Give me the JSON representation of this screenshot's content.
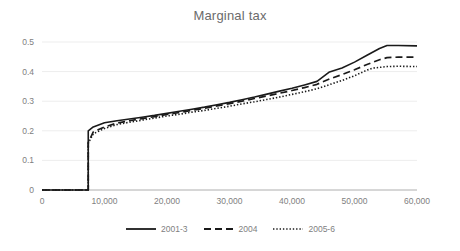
{
  "chart_data": {
    "type": "line",
    "title": "Marginal tax",
    "xlabel": "",
    "ylabel": "",
    "xlim": [
      0,
      60000
    ],
    "ylim": [
      0,
      0.5
    ],
    "grid": true,
    "grid_axis": "y",
    "legend_position": "bottom",
    "y_ticks": [
      "0",
      "0.1",
      "0.2",
      "0.3",
      "0.4",
      "0.5"
    ],
    "y_tick_values": [
      0,
      0.1,
      0.2,
      0.3,
      0.4,
      0.5
    ],
    "x_ticks": [
      "0",
      "10,000",
      "20,000",
      "30,000",
      "40,000",
      "50,000",
      "60,000"
    ],
    "x_tick_values": [
      0,
      10000,
      20000,
      30000,
      40000,
      50000,
      60000
    ],
    "series": [
      {
        "name": "2001-3",
        "style": "solid",
        "color": "#1a1a1a",
        "x": [
          0,
          7400,
          7400,
          8200,
          10000,
          12000,
          14000,
          16000,
          18000,
          20000,
          22000,
          24000,
          26000,
          28000,
          30000,
          32000,
          34000,
          36000,
          38000,
          40000,
          42000,
          44000,
          46000,
          48000,
          50000,
          52000,
          54000,
          55200,
          57000,
          60000
        ],
        "y": [
          0,
          0,
          0.2,
          0.213,
          0.227,
          0.234,
          0.24,
          0.246,
          0.252,
          0.259,
          0.266,
          0.273,
          0.28,
          0.288,
          0.296,
          0.305,
          0.314,
          0.324,
          0.334,
          0.344,
          0.355,
          0.367,
          0.399,
          0.412,
          0.432,
          0.455,
          0.478,
          0.488,
          0.488,
          0.487
        ]
      },
      {
        "name": "2004",
        "style": "dashed",
        "color": "#1a1a1a",
        "x": [
          0,
          7400,
          7400,
          8200,
          10000,
          12000,
          14000,
          16000,
          18000,
          20000,
          22000,
          24000,
          26000,
          28000,
          30000,
          32000,
          34000,
          36000,
          38000,
          40000,
          42000,
          44000,
          46000,
          48000,
          50000,
          52000,
          54000,
          55200,
          57000,
          60000
        ],
        "y": [
          0,
          0,
          0.16,
          0.196,
          0.213,
          0.226,
          0.234,
          0.241,
          0.248,
          0.255,
          0.262,
          0.269,
          0.276,
          0.284,
          0.292,
          0.3,
          0.309,
          0.318,
          0.327,
          0.336,
          0.346,
          0.357,
          0.375,
          0.39,
          0.406,
          0.424,
          0.44,
          0.447,
          0.449,
          0.449
        ]
      },
      {
        "name": "2005-6",
        "style": "dotted",
        "color": "#1a1a1a",
        "x": [
          0,
          7400,
          7400,
          8200,
          10000,
          12000,
          14000,
          16000,
          18000,
          20000,
          22000,
          24000,
          26000,
          28000,
          30000,
          32000,
          34000,
          36000,
          38000,
          40000,
          42000,
          44000,
          46000,
          48000,
          50000,
          52000,
          53000,
          55200,
          57000,
          60000
        ],
        "y": [
          0,
          0,
          0.158,
          0.19,
          0.208,
          0.221,
          0.229,
          0.236,
          0.243,
          0.25,
          0.256,
          0.263,
          0.269,
          0.276,
          0.283,
          0.291,
          0.298,
          0.306,
          0.314,
          0.323,
          0.332,
          0.342,
          0.356,
          0.37,
          0.386,
          0.405,
          0.412,
          0.417,
          0.418,
          0.417
        ]
      }
    ]
  },
  "title": "Marginal tax",
  "legend": [
    {
      "label": "2001-3"
    },
    {
      "label": "2004"
    },
    {
      "label": "2005-6"
    }
  ]
}
